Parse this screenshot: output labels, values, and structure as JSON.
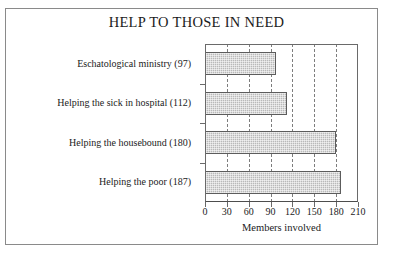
{
  "figure": {
    "frame_color": "#8a8a8a",
    "background": "#ffffff"
  },
  "chart_data": {
    "type": "bar",
    "orientation": "horizontal",
    "title": "HELP TO THOSE IN NEED",
    "xlabel": "Members involved",
    "ylabel": "",
    "categories": [
      "Eschatological ministry (97)",
      "Helping the sick in hospital (112)",
      "Helping the housebound (180)",
      "Helping the poor (187)"
    ],
    "category_names": [
      "Eschatological ministry",
      "Helping the sick in hospital",
      "Helping the housebound",
      "Helping the poor"
    ],
    "values": [
      97,
      112,
      180,
      187
    ],
    "xlim": [
      0,
      210
    ],
    "xticks": [
      0,
      30,
      60,
      90,
      120,
      150,
      180,
      210
    ],
    "xtick_labels": [
      "0",
      "30",
      "60",
      "90",
      "120",
      "150",
      "180",
      "210"
    ],
    "grid": true,
    "grid_style": "dashed vertical",
    "legend": "none",
    "bar_fill": "#b9b9b9",
    "bar_edge": "#5c5c5c",
    "grid_color": "#7d7d7d",
    "axis_color": "#6a6a6a"
  }
}
